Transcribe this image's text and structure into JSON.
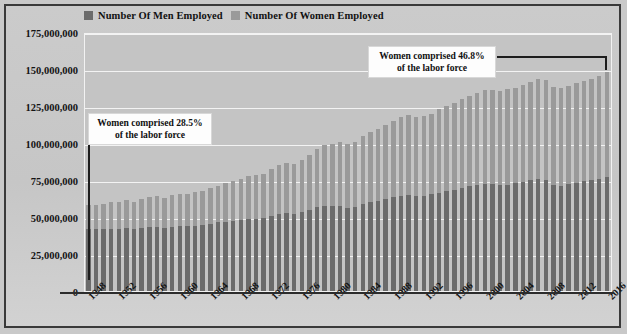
{
  "legend": {
    "items": [
      {
        "label": "Number Of Men Employed",
        "color": "#6b6b6b",
        "name": "legend-men"
      },
      {
        "label": "Number Of Women Employed",
        "color": "#9a9a9a",
        "name": "legend-women"
      }
    ]
  },
  "annotations": [
    {
      "id": "anno-left",
      "line1": "Women comprised 28.5%",
      "line2": "of the labor force"
    },
    {
      "id": "anno-right",
      "line1": "Women comprised 46.8%",
      "line2": "of the labor force"
    }
  ],
  "colors": {
    "men": "#6b6b6b",
    "women": "#9a9a9a",
    "plot_background": "#c4c4c4",
    "gridline": "#f3f3f3",
    "frame": "#3a3a3a",
    "text": "#141414"
  },
  "chart_data": {
    "type": "bar",
    "stacked": true,
    "title": "",
    "xlabel": "",
    "ylabel": "",
    "ylim": [
      0,
      175000000
    ],
    "ytick_labels": [
      "175,000,000",
      "150,000,000",
      "125,000,000",
      "100,000,000",
      "75,000,000",
      "50,000,000",
      "25,000,000",
      "0"
    ],
    "yticks": [
      175000000,
      150000000,
      125000000,
      100000000,
      75000000,
      50000000,
      25000000,
      0
    ],
    "grid": true,
    "legend_position": "top-left",
    "xtick_labels": [
      "1948",
      "1952",
      "1956",
      "1960",
      "1964",
      "1968",
      "1972",
      "1976",
      "1980",
      "1984",
      "1988",
      "1992",
      "1996",
      "2000",
      "2004",
      "2008",
      "2012",
      "2016"
    ],
    "categories": [
      "1948",
      "1949",
      "1950",
      "1951",
      "1952",
      "1953",
      "1954",
      "1955",
      "1956",
      "1957",
      "1958",
      "1959",
      "1960",
      "1961",
      "1962",
      "1963",
      "1964",
      "1965",
      "1966",
      "1967",
      "1968",
      "1969",
      "1970",
      "1971",
      "1972",
      "1973",
      "1974",
      "1975",
      "1976",
      "1977",
      "1978",
      "1979",
      "1980",
      "1981",
      "1982",
      "1983",
      "1984",
      "1985",
      "1986",
      "1987",
      "1988",
      "1989",
      "1990",
      "1991",
      "1992",
      "1993",
      "1994",
      "1995",
      "1996",
      "1997",
      "1998",
      "1999",
      "2000",
      "2001",
      "2002",
      "2003",
      "2004",
      "2005",
      "2006",
      "2007",
      "2008",
      "2009",
      "2010",
      "2011",
      "2012",
      "2013",
      "2014",
      "2015",
      "2016"
    ],
    "series": [
      {
        "name": "Number Of Men Employed",
        "color": "#6b6b6b",
        "values": [
          41726000,
          41684000,
          41580000,
          41780000,
          41684000,
          42430000,
          41619000,
          42621000,
          43379000,
          43357000,
          42423000,
          43466000,
          43904000,
          43656000,
          44177000,
          44657000,
          45474000,
          46340000,
          46919000,
          47479000,
          48114000,
          48818000,
          48990000,
          49390000,
          50896000,
          52349000,
          53024000,
          51857000,
          53138000,
          54728000,
          56479000,
          57607000,
          57186000,
          57397000,
          56271000,
          56787000,
          59091000,
          59891000,
          60892000,
          62107000,
          63273000,
          64315000,
          65104000,
          64223000,
          64440000,
          65349000,
          66450000,
          67377000,
          68207000,
          69685000,
          70693000,
          71446000,
          72293000,
          72080000,
          71648000,
          71852000,
          72688000,
          73638000,
          74893000,
          75412000,
          74750000,
          71341000,
          71230000,
          72033000,
          73180000,
          74170000,
          75030000,
          76020000,
          77000000
        ]
      },
      {
        "name": "Number Of Women Employed",
        "color": "#9a9a9a",
        "values": [
          16617000,
          16723000,
          17340000,
          18182000,
          18570000,
          18749000,
          18490000,
          19551000,
          20419000,
          20714000,
          20613000,
          21164000,
          21874000,
          22090000,
          22525000,
          23105000,
          23831000,
          24748000,
          25976000,
          26893000,
          27807000,
          28707000,
          29688000,
          29976000,
          31257000,
          32715000,
          33769000,
          33989000,
          35615000,
          37289000,
          39569000,
          41217000,
          42117000,
          43000000,
          43256000,
          44047000,
          45915000,
          47259000,
          48706000,
          50334000,
          51696000,
          53027000,
          53689000,
          53496000,
          53793000,
          54396000,
          56610000,
          57523000,
          58501000,
          59873000,
          60771000,
          62042000,
          63586000,
          63737000,
          63582000,
          64404000,
          64728000,
          65757000,
          66585000,
          67792000,
          67876000,
          66208000,
          65821000,
          66210000,
          67080000,
          67800000,
          68500000,
          69300000,
          70800000
        ]
      }
    ]
  }
}
